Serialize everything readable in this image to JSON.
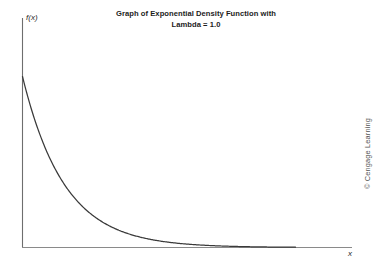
{
  "figure": {
    "width": 392,
    "height": 268,
    "background": "#ffffff"
  },
  "title": {
    "line1": "Graph of Exponential Density Function with",
    "line2": "Lambda = 1.0"
  },
  "axes": {
    "y_label": "f(x)",
    "x_label": "x",
    "axis_color": "#6e6e6e",
    "curve_color": "#3a3a3a"
  },
  "credit": {
    "text": "© Cengage Learning"
  },
  "chart_data": {
    "type": "line",
    "title": "Graph of Exponential Density Function with Lambda = 1.0",
    "xlabel": "x",
    "ylabel": "f(x)",
    "legend": [],
    "grid": false,
    "annotations": [
      "© Cengage Learning"
    ],
    "lambda": 1.0,
    "function": "f(x) = lambda * exp(-lambda * x)",
    "xlim": [
      0,
      6.5
    ],
    "ylim": [
      0,
      1.12
    ],
    "x_tick_labels": [],
    "y_tick_labels": [],
    "x": [
      0,
      0.2,
      0.4,
      0.6,
      0.8,
      1.0,
      1.2,
      1.4,
      1.6,
      1.8,
      2.0,
      2.2,
      2.4,
      2.6,
      2.8,
      3.0,
      3.2,
      3.4,
      3.6,
      3.8,
      4.0,
      4.2,
      4.4,
      4.6,
      4.8,
      5.0,
      5.2,
      5.4,
      5.6,
      5.8,
      6.0
    ],
    "y": [
      1.0,
      0.8187,
      0.6703,
      0.5488,
      0.4493,
      0.3679,
      0.3012,
      0.2466,
      0.2019,
      0.1653,
      0.1353,
      0.1108,
      0.0907,
      0.0743,
      0.0608,
      0.0498,
      0.0408,
      0.0334,
      0.0273,
      0.0224,
      0.0183,
      0.015,
      0.0123,
      0.0101,
      0.0082,
      0.0067,
      0.0055,
      0.0045,
      0.0037,
      0.003,
      0.0025
    ]
  }
}
